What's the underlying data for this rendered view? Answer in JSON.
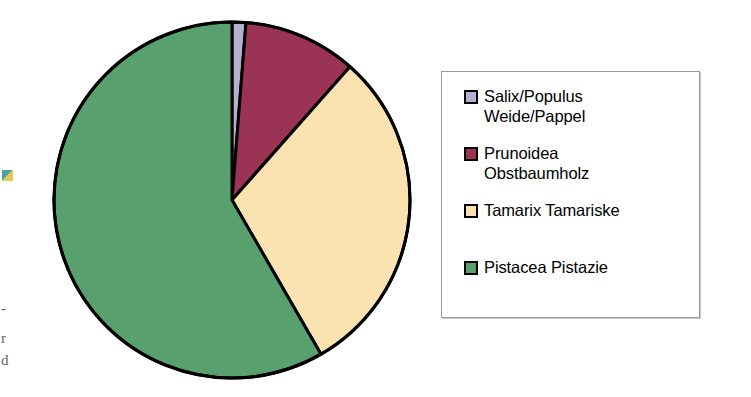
{
  "chart_data": {
    "type": "pie",
    "title": "",
    "subtitle": "",
    "xlabel": "",
    "ylabel": "",
    "legend_position": "right",
    "grid": false,
    "categories": [
      "Salix/Populus Weide/Pappel",
      "Prunoidea Obstbaumholz",
      "Tamarix Tamariske",
      "Pistacea Pistazie"
    ],
    "values": [
      1.25,
      10.3,
      30.2,
      58.25
    ],
    "unit": "percent",
    "start_angle_deg": 0,
    "direction": "clockwise",
    "slices": [
      {
        "label": "Salix/Populus Weide/Pappel",
        "value": 1.25,
        "color": "#B5B0D0",
        "start_deg": 0.0,
        "end_deg": 4.5
      },
      {
        "label": "Prunoidea Obstbaumholz",
        "value": 10.3,
        "color": "#9B3355",
        "start_deg": 4.5,
        "end_deg": 41.5
      },
      {
        "label": "Tamarix Tamariske",
        "value": 30.2,
        "color": "#FAE3B0",
        "start_deg": 41.5,
        "end_deg": 150.0
      },
      {
        "label": "Pistacea Pistazie",
        "value": 58.25,
        "color": "#58A06E",
        "start_deg": 150.0,
        "end_deg": 360.0
      }
    ],
    "outline_color": "#000000",
    "outline_width": 3
  },
  "legend": {
    "entries": [
      {
        "label": "Salix/Populus\nWeide/Pappel",
        "color": "#B5B0D0",
        "swatch_name": "legend-swatch-salix-populus"
      },
      {
        "label": "Prunoidea\nObstbaumholz",
        "color": "#9B3355",
        "swatch_name": "legend-swatch-prunoidea"
      },
      {
        "label": "Tamarix Tamariske",
        "color": "#FAE3B0",
        "swatch_name": "legend-swatch-tamarix"
      },
      {
        "label": "Pistacea Pistazie",
        "color": "#58A06E",
        "swatch_name": "legend-swatch-pistacea"
      }
    ]
  },
  "page_edge_artifacts": {
    "color_mark": "",
    "clipped_letter_1": "r",
    "clipped_letter_2": "d",
    "clipped_dash": "-"
  }
}
